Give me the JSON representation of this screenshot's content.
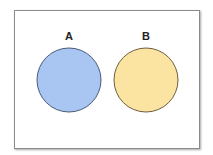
{
  "diagram": {
    "type": "venn-disjoint",
    "sets": [
      {
        "label": "A",
        "fill": "#a9c5f2",
        "stroke": "#4a5a78",
        "cx": 69,
        "cy": 80,
        "r": 32
      },
      {
        "label": "B",
        "fill": "#fbe4a2",
        "stroke": "#6e5e3a",
        "cx": 146,
        "cy": 80,
        "r": 32
      }
    ]
  }
}
